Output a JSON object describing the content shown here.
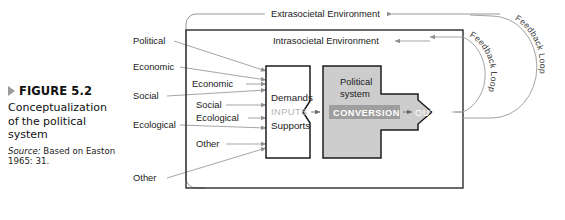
{
  "caption": {
    "marker_icon": "triangle-right-icon",
    "figure_number": "FIGURE 5.2",
    "title": "Conceptualization of the political system",
    "source_label": "Source:",
    "source_text": " Based on Easton 1965: 31."
  },
  "diagram": {
    "environments": {
      "extrasocietal": "Extrasocietal Environment",
      "intrasocietal": "Intrasocietal Environment"
    },
    "outer_inputs": [
      "Political",
      "Economic",
      "Social",
      "Ecological",
      "Other"
    ],
    "inner_inputs": [
      "Economic",
      "Social",
      "Ecological",
      "Other"
    ],
    "demands_box": {
      "demands": "Demands",
      "inputs": "INPUTS",
      "supports": "Supports"
    },
    "political_system": {
      "title_line1": "Political",
      "title_line2": "system",
      "conversion": "CONVERSION"
    },
    "outputs": "OUTPUTS",
    "feedback_loops": [
      "Feedback Loop",
      "Feedback Loop"
    ],
    "colors": {
      "system_fill": "#cdcdcd",
      "conversion_bar": "#9e9e9e",
      "inputs_text": "#b4b4b4",
      "frame_stroke": "#2b2b2b",
      "connector_stroke": "#8f8f8f"
    }
  }
}
